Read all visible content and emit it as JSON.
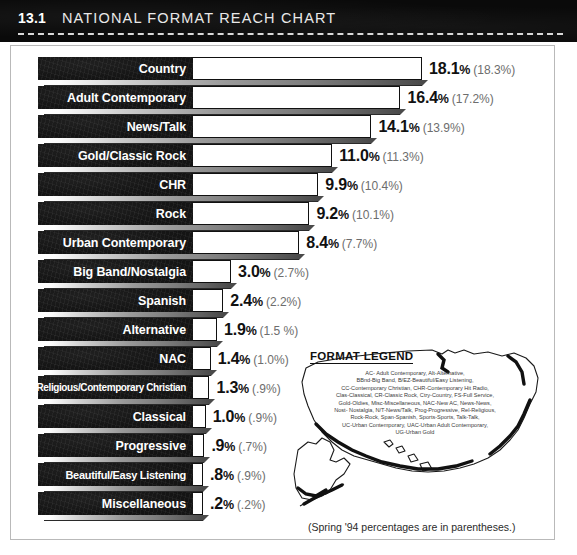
{
  "header": {
    "number": "13.1",
    "title": "NATIONAL FORMAT REACH CHART"
  },
  "footnote": "(Spring '94 percentages are in parentheses.)",
  "legend": {
    "title": "FORMAT LEGEND",
    "lines": [
      "AC- Adult Contemporary,  Alt-Alternative,",
      "BBnd-Big Band,  B/EZ-Beautiful/Easy Listening,",
      "CC-Contemporary Christian,  CHR-Contemporary Hit Radio,",
      "Clas-Classical,  CR-Classic Rock,  Ctry-Country,  FS-Full Service,",
      "Gold-Oldies,  Misc-Miscellaneous,  NAC-New AC,  News-News,",
      "Nost- Nostalgia,  N/T-News/Talk,  Prog-Progressive,  Rel-Religious,",
      "Rock-Rock,  Span-Spanish,  Sports-Sports,  Talk-Talk,",
      "UC-Urban Contemporary,  UAC-Urban Adult Contemporary,",
      "UG-Urban Gold"
    ]
  },
  "chart_data": {
    "type": "bar",
    "title": "NATIONAL FORMAT REACH CHART",
    "xlabel": "",
    "ylabel": "",
    "orientation": "horizontal",
    "note": "(Spring '94 percentages are in parentheses.)",
    "categories": [
      "Country",
      "Adult Contemporary",
      "News/Talk",
      "Gold/Classic Rock",
      "CHR",
      "Rock",
      "Urban Contemporary",
      "Big Band/Nostalgia",
      "Spanish",
      "Alternative",
      "NAC",
      "Religious/Contemporary Christian",
      "Classical",
      "Progressive",
      "Beautiful/Easy Listening",
      "Miscellaneous"
    ],
    "series": [
      {
        "name": "Current",
        "values": [
          18.1,
          16.4,
          14.1,
          11.0,
          9.9,
          9.2,
          8.4,
          3.0,
          2.4,
          1.9,
          1.4,
          1.3,
          1.0,
          0.9,
          0.8,
          0.2
        ],
        "labels": [
          "18.1%",
          "16.4%",
          "14.1%",
          "11.0%",
          "9.9%",
          "9.2%",
          "8.4%",
          "3.0%",
          "2.4%",
          "1.9%",
          "1.4%",
          "1.3%",
          "1.0%",
          ".9%",
          ".8%",
          ".2%"
        ]
      },
      {
        "name": "Spring '94",
        "values": [
          18.3,
          17.2,
          13.9,
          11.3,
          10.4,
          10.1,
          7.7,
          2.7,
          2.2,
          1.5,
          1.0,
          0.9,
          0.9,
          0.7,
          0.9,
          0.2
        ],
        "labels": [
          "(18.3%)",
          "(17.2%)",
          "(13.9%)",
          "(11.3%)",
          "(10.4%)",
          "(10.1%)",
          "(7.7%)",
          "(2.7%)",
          "(2.2%)",
          "(1.5 %)",
          "(1.0%)",
          "(.9%)",
          "(.9%)",
          "(.7%)",
          "(.9%)",
          "(.2%)"
        ]
      }
    ],
    "xlim": [
      0,
      18.1
    ],
    "grid": false,
    "legend_position": "none"
  },
  "rows": [
    {
      "label": "Country",
      "value": 18.1,
      "main": "18.1",
      "paren": "(18.3%)",
      "size": ""
    },
    {
      "label": "Adult Contemporary",
      "value": 16.4,
      "main": "16.4",
      "paren": "(17.2%)",
      "size": ""
    },
    {
      "label": "News/Talk",
      "value": 14.1,
      "main": "14.1",
      "paren": "(13.9%)",
      "size": ""
    },
    {
      "label": "Gold/Classic Rock",
      "value": 11.0,
      "main": "11.0",
      "paren": "(11.3%)",
      "size": ""
    },
    {
      "label": "CHR",
      "value": 9.9,
      "main": "9.9",
      "paren": "(10.4%)",
      "size": ""
    },
    {
      "label": "Rock",
      "value": 9.2,
      "main": "9.2",
      "paren": "(10.1%)",
      "size": ""
    },
    {
      "label": "Urban Contemporary",
      "value": 8.4,
      "main": "8.4",
      "paren": "(7.7%)",
      "size": ""
    },
    {
      "label": "Big Band/Nostalgia",
      "value": 3.0,
      "main": "3.0",
      "paren": "(2.7%)",
      "size": ""
    },
    {
      "label": "Spanish",
      "value": 2.4,
      "main": "2.4",
      "paren": "(2.2%)",
      "size": ""
    },
    {
      "label": "Alternative",
      "value": 1.9,
      "main": "1.9",
      "paren": "(1.5 %)",
      "size": ""
    },
    {
      "label": "NAC",
      "value": 1.4,
      "main": "1.4",
      "paren": "(1.0%)",
      "size": ""
    },
    {
      "label": "Religious/Contemporary Christian",
      "value": 1.3,
      "main": "1.3",
      "paren": "(.9%)",
      "size": "xs"
    },
    {
      "label": "Classical",
      "value": 1.0,
      "main": "1.0",
      "paren": "(.9%)",
      "size": ""
    },
    {
      "label": "Progressive",
      "value": 0.9,
      "main": ".9",
      "paren": "(.7%)",
      "size": ""
    },
    {
      "label": "Beautiful/Easy Listening",
      "value": 0.8,
      "main": ".8",
      "paren": "(.9%)",
      "size": "sm"
    },
    {
      "label": "Miscellaneous",
      "value": 0.2,
      "main": ".2",
      "paren": "(.2%)",
      "size": ""
    }
  ]
}
